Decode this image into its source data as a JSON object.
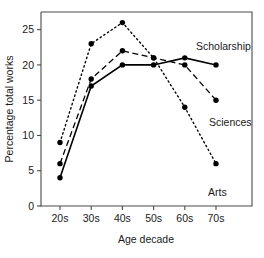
{
  "chart_data": {
    "type": "line",
    "title": "",
    "xlabel": "Age decade",
    "ylabel": "Percentage total works",
    "categories": [
      "20s",
      "30s",
      "40s",
      "50s",
      "60s",
      "70s"
    ],
    "x_tick_labels": [
      "20s",
      "30s",
      "40s",
      "50s",
      "60s",
      "70s"
    ],
    "y_tick_labels": [
      "0",
      "5",
      "10",
      "15",
      "20",
      "25"
    ],
    "y_ticks": [
      0,
      5,
      10,
      15,
      20,
      25
    ],
    "ylim": [
      0,
      27.5
    ],
    "grid": false,
    "legend_position": "inline-right-of-line-ends",
    "series": [
      {
        "name": "Arts",
        "label": "Arts",
        "line_style": "dotted",
        "marker": "filled-circle",
        "color": "#000000",
        "values": [
          9,
          23,
          26,
          21,
          14,
          6
        ]
      },
      {
        "name": "Sciences",
        "label": "Sciences",
        "line_style": "dashed",
        "marker": "filled-circle",
        "color": "#000000",
        "values": [
          6,
          18,
          22,
          21,
          20,
          15
        ]
      },
      {
        "name": "Scholarship",
        "label": "Scholarship",
        "line_style": "solid",
        "marker": "filled-circle",
        "color": "#000000",
        "values": [
          4,
          17,
          20,
          20,
          21,
          20
        ]
      }
    ],
    "annotations": [
      {
        "text": "Scholarship",
        "series": "Scholarship"
      },
      {
        "text": "Sciences",
        "series": "Sciences"
      },
      {
        "text": "Arts",
        "series": "Arts"
      }
    ]
  }
}
